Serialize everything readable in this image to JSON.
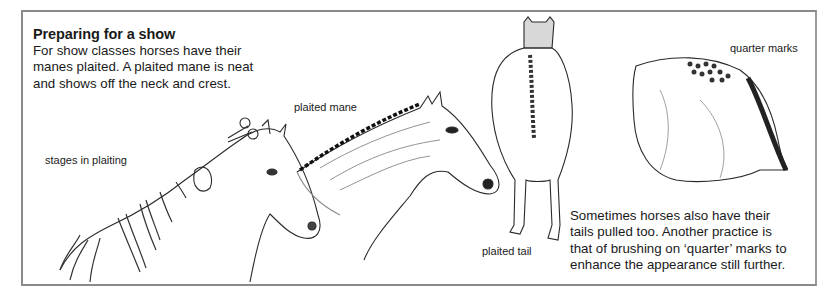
{
  "heading": "Preparing for a show",
  "intro_lines": [
    "For show classes horses have their",
    "manes plaited. A plaited mane is neat",
    "and shows off the neck and crest."
  ],
  "labels": {
    "stages": "stages in plaiting",
    "mane": "plaited mane",
    "tail": "plaited tail",
    "quarter": "quarter marks"
  },
  "note_lines": [
    "Sometimes horses also have their",
    "tails pulled too. Another practice is",
    "that of brushing on ‘quarter’ marks to",
    "enhance the appearance still further."
  ],
  "illustrations": [
    "horse-head-plaiting-stages",
    "horse-head-plaited-mane",
    "horse-rear-plaited-tail",
    "horse-hindquarter-quarter-marks"
  ]
}
